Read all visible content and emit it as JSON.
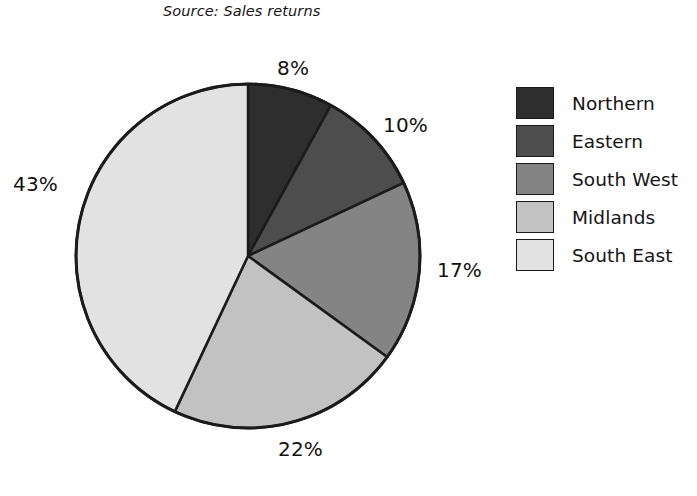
{
  "caption": {
    "source_text": "Source: Sales returns"
  },
  "chart_data": {
    "type": "pie",
    "title": "",
    "subtitle": "Source: Sales returns",
    "xlabel": "",
    "ylabel": "",
    "legend_position": "right",
    "grid": false,
    "start_angle_deg": 0,
    "direction": "clockwise",
    "categories": [
      "Northern",
      "Eastern",
      "South West",
      "Midlands",
      "South East"
    ],
    "values": [
      8,
      10,
      17,
      22,
      43
    ],
    "value_unit": "%",
    "data_labels": [
      "8%",
      "10%",
      "17%",
      "22%",
      "43%"
    ],
    "slice_colors": [
      "#2e2e2e",
      "#4d4d4d",
      "#848484",
      "#c2c2c2",
      "#e2e2e2"
    ],
    "outline_color": "#1b1b1b",
    "slices": [
      {
        "label": "Northern",
        "value": 8,
        "data_label": "8%",
        "color": "#2e2e2e"
      },
      {
        "label": "Eastern",
        "value": 10,
        "data_label": "10%",
        "color": "#4d4d4d"
      },
      {
        "label": "South West",
        "value": 17,
        "data_label": "17%",
        "color": "#848484"
      },
      {
        "label": "Midlands",
        "value": 22,
        "data_label": "22%",
        "color": "#c2c2c2"
      },
      {
        "label": "South East",
        "value": 43,
        "data_label": "43%",
        "color": "#e2e2e2"
      }
    ]
  },
  "legend": {
    "items": [
      {
        "label": "Northern",
        "color": "#2e2e2e"
      },
      {
        "label": "Eastern",
        "color": "#4d4d4d"
      },
      {
        "label": "South West",
        "color": "#848484"
      },
      {
        "label": "Midlands",
        "color": "#c2c2c2"
      },
      {
        "label": "South East",
        "color": "#e2e2e2"
      }
    ]
  },
  "labels": {
    "northern_pct": "8%",
    "eastern_pct": "10%",
    "south_west_pct": "17%",
    "midlands_pct": "22%",
    "south_east_pct": "43%"
  }
}
